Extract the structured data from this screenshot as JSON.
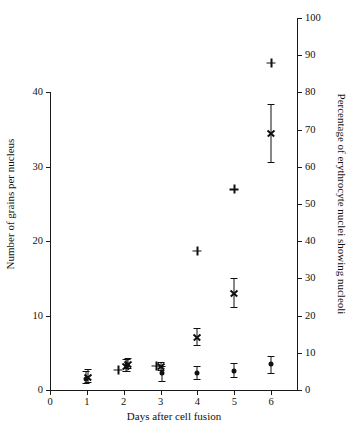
{
  "chart_data": {
    "type": "scatter",
    "title": "",
    "xlabel": "Days after cell fusion",
    "ylabel": "Number of grains per nucleus",
    "ylabel_right": "Percentage of erythrocyte nuclei showing nucleoli",
    "xlim": [
      0,
      6.7
    ],
    "ylim": [
      0,
      40
    ],
    "ylim_right": [
      0,
      100
    ],
    "xticks": [
      0,
      1,
      2,
      3,
      4,
      5,
      6
    ],
    "xtick_labels": [
      "0",
      "1",
      "2",
      "3",
      "4",
      "5",
      "6"
    ],
    "yticks": [
      0,
      10,
      20,
      30,
      40
    ],
    "ytick_labels": [
      "0",
      "10",
      "20",
      "30",
      "40"
    ],
    "yticks_right": [
      0,
      10,
      20,
      30,
      40,
      50,
      60,
      70,
      80,
      90,
      100
    ],
    "ytick_labels_right": [
      "0",
      "10",
      "20",
      "30",
      "40",
      "50",
      "60",
      "70",
      "80",
      "90",
      "100"
    ],
    "grid": false,
    "legend": "none",
    "series": [
      {
        "name": "Grains per nucleus (upper group)",
        "axis": "left",
        "marker": "cross-with-errorbar",
        "points": [
          {
            "x": 1.02,
            "y": 1.8,
            "yerr_low": 1.1,
            "yerr_high": 2.8
          },
          {
            "x": 2.05,
            "y": 3.2,
            "yerr_low": 2.5,
            "yerr_high": 4.1
          },
          {
            "x": 2.12,
            "y": 3.5,
            "yerr_low": 2.9,
            "yerr_high": 4.3
          },
          {
            "x": 3.0,
            "y": 3.2,
            "yerr_low": 2.7,
            "yerr_high": 3.8
          },
          {
            "x": 4.0,
            "y": 7.1,
            "yerr_low": 6.0,
            "yerr_high": 8.4
          },
          {
            "x": 5.0,
            "y": 13.0,
            "yerr_low": 11.1,
            "yerr_high": 15.0
          },
          {
            "x": 6.0,
            "y": 34.5,
            "yerr_low": 30.6,
            "yerr_high": 38.4
          }
        ]
      },
      {
        "name": "Grains per nucleus (lower group)",
        "axis": "left",
        "marker": "filled-circle-with-errorbar",
        "points": [
          {
            "x": 0.98,
            "y": 1.5,
            "yerr_low": 0.9,
            "yerr_high": 2.5
          },
          {
            "x": 2.08,
            "y": 3.3,
            "yerr_low": 2.6,
            "yerr_high": 4.2
          },
          {
            "x": 3.05,
            "y": 2.3,
            "yerr_low": 1.2,
            "yerr_high": 3.2
          },
          {
            "x": 4.0,
            "y": 2.3,
            "yerr_low": 1.5,
            "yerr_high": 3.2
          },
          {
            "x": 5.0,
            "y": 2.6,
            "yerr_low": 1.7,
            "yerr_high": 3.6
          },
          {
            "x": 6.0,
            "y": 3.5,
            "yerr_low": 2.3,
            "yerr_high": 4.6
          }
        ]
      },
      {
        "name": "Percentage of erythrocyte nuclei showing nucleoli",
        "axis": "right",
        "marker": "plus",
        "points": [
          {
            "x": 1.85,
            "y": 5.5
          },
          {
            "x": 2.88,
            "y": 6.5
          },
          {
            "x": 4.0,
            "y": 37.5
          },
          {
            "x": 5.0,
            "y": 54.0
          },
          {
            "x": 6.0,
            "y": 88.0
          }
        ]
      }
    ]
  },
  "axes": {
    "left_title": "Number of grains per nucleus",
    "right_title": "Percentage of erythrocyte nuclei showing nucleoli",
    "bottom_title": "Days after cell fusion",
    "left_ticks": [
      "0",
      "10",
      "20",
      "30",
      "40"
    ],
    "right_ticks": [
      "0",
      "10",
      "20",
      "30",
      "40",
      "50",
      "60",
      "70",
      "80",
      "90",
      "100"
    ],
    "bottom_ticks": [
      "0",
      "1",
      "2",
      "3",
      "4",
      "5",
      "6"
    ]
  },
  "colors": {
    "ink": "#111111",
    "background": "#ffffff"
  }
}
